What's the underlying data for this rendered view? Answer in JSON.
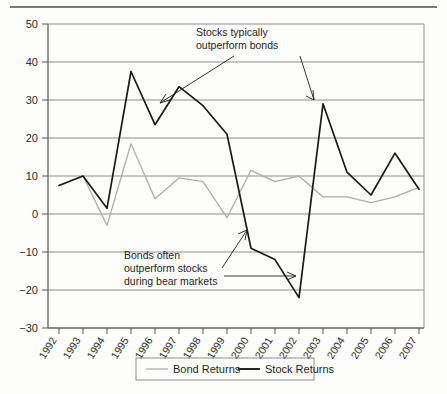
{
  "chart_data": {
    "type": "line",
    "title": "",
    "xlabel": "",
    "ylabel": "",
    "grid": "horizontal",
    "legend_position": "bottom",
    "ylim": [
      -30,
      50
    ],
    "yticks": [
      50,
      40,
      30,
      20,
      10,
      0,
      -10,
      -20,
      -30
    ],
    "categories": [
      "1992",
      "1993",
      "1994",
      "1995",
      "1996",
      "1997",
      "1998",
      "1999",
      "2000",
      "2001",
      "2002",
      "2003",
      "2004",
      "2005",
      "2006",
      "2007"
    ],
    "series": [
      {
        "name": "Bond Returns",
        "color": "#adadad",
        "values": [
          7.5,
          10.0,
          -3.0,
          18.5,
          4.0,
          9.5,
          8.5,
          -1.0,
          11.5,
          8.5,
          10.0,
          4.5,
          4.5,
          3.0,
          4.5,
          7.0
        ]
      },
      {
        "name": "Stock Returns",
        "color": "#1a1a1a",
        "values": [
          7.5,
          10.0,
          1.5,
          37.5,
          23.5,
          33.5,
          28.5,
          21.0,
          -9.0,
          -12.0,
          -22.0,
          29.0,
          11.0,
          5.0,
          16.0,
          6.5
        ]
      }
    ],
    "annotations": [
      {
        "id": "stocks-outperform",
        "lines": [
          "Stocks typically",
          "outperform bonds"
        ],
        "target_category": "1996",
        "target_value": 23.5
      },
      {
        "id": "bonds-outperform",
        "lines": [
          "Bonds often",
          "outperform stocks",
          "during bear markets"
        ],
        "target_category": "2002",
        "target_value": -22.0
      }
    ]
  },
  "legend": {
    "items": [
      {
        "label": "Bond Returns",
        "color": "#adadad"
      },
      {
        "label": "Stock Returns",
        "color": "#1a1a1a"
      }
    ]
  },
  "yticks": {
    "t0": "50",
    "t1": "40",
    "t2": "30",
    "t3": "20",
    "t4": "10",
    "t5": "0",
    "t6": "−10",
    "t7": "−20",
    "t8": "−30"
  },
  "xticks": {
    "x0": "1992",
    "x1": "1993",
    "x2": "1994",
    "x3": "1995",
    "x4": "1996",
    "x5": "1997",
    "x6": "1998",
    "x7": "1999",
    "x8": "2000",
    "x9": "2001",
    "x10": "2002",
    "x11": "2003",
    "x12": "2004",
    "x13": "2005",
    "x14": "2006",
    "x15": "2007"
  },
  "annotation_text": {
    "stocks_l1": "Stocks typically",
    "stocks_l2": "outperform bonds",
    "bonds_l1": "Bonds often",
    "bonds_l2": "outperform stocks",
    "bonds_l3": "during bear markets"
  }
}
